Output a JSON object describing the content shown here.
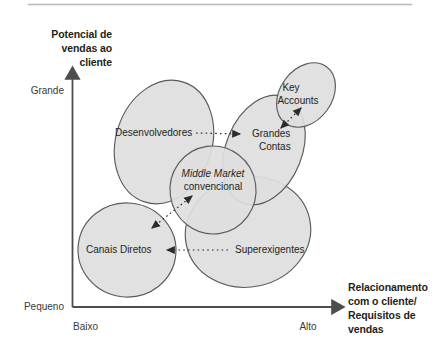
{
  "figure": {
    "type": "bubble-positioning-diagram",
    "top_rule": true,
    "background_color": "#ffffff",
    "ellipse_fill": "#dedede",
    "ellipse_stroke": "#5a5a5a",
    "axis_color": "#4d4d4d",
    "text_color": "#231f20"
  },
  "axes": {
    "y": {
      "title_lines": [
        "Potencial de",
        "vendas ao",
        "cliente"
      ],
      "high_label": "Grande",
      "low_label": "Pequeno"
    },
    "x": {
      "title_lines": [
        "Relacionamento",
        "com o cliente/",
        "Requisitos de",
        "vendas"
      ],
      "low_label": "Baixo",
      "high_label": "Alto"
    }
  },
  "bubbles": [
    {
      "id": "desenvolvedores",
      "label": "Desenvolvedores",
      "label_lines": [
        "Desenvolvedores"
      ],
      "italic": false
    },
    {
      "id": "key-accounts",
      "label": "Key Accounts",
      "label_lines": [
        "Key",
        "Accounts"
      ],
      "italic": false
    },
    {
      "id": "grandes-contas",
      "label": "Grandes Contas",
      "label_lines": [
        "Grandes",
        "Contas"
      ],
      "italic": false
    },
    {
      "id": "middle-market",
      "label": "Middle Market convencional",
      "label_lines": [
        "Middle Market",
        "convencional"
      ],
      "italic": true
    },
    {
      "id": "canais-diretos",
      "label": "Canais Diretos",
      "label_lines": [
        "Canais Diretos"
      ],
      "italic": false
    },
    {
      "id": "superexigentes",
      "label": "Superexigentes",
      "label_lines": [
        "Superexigentes"
      ],
      "italic": false
    }
  ],
  "connectors": [
    {
      "id": "desenvolvedores-to-grandes-contas",
      "style": "dotted",
      "heads": "single"
    },
    {
      "id": "key-accounts-to-grandes-contas",
      "style": "dotted",
      "heads": "double"
    },
    {
      "id": "middle-market-to-canais-diretos",
      "style": "dotted",
      "heads": "double"
    },
    {
      "id": "superexigentes-to-canais-diretos",
      "style": "dotted",
      "heads": "single"
    }
  ]
}
